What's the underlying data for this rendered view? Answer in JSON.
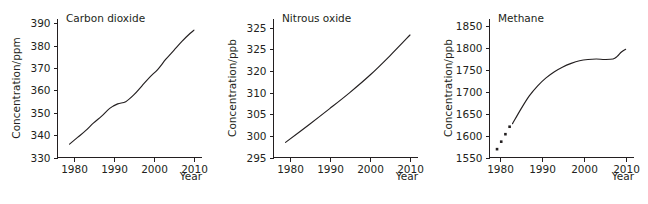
{
  "figure": {
    "background": "#ffffff",
    "ink_color": "#231f20",
    "panel_count": 3
  },
  "chart_data": [
    {
      "type": "line",
      "title": "Carbon dioxide",
      "xlabel": "Year",
      "ylabel": "Concentration/ppm",
      "xlim": [
        1976,
        2012
      ],
      "ylim": [
        330,
        392
      ],
      "xticks": [
        1980,
        1990,
        2000,
        2010
      ],
      "xtick_labels": [
        "1980",
        "1990",
        "2000",
        "2010"
      ],
      "yticks": [
        330,
        340,
        350,
        360,
        370,
        380,
        390
      ],
      "ytick_labels": [
        "330",
        "340",
        "350",
        "360",
        "370",
        "380",
        "390"
      ],
      "grid": false,
      "legend": "none",
      "x": [
        1979,
        1981,
        1983,
        1985,
        1987,
        1989,
        1991,
        1993,
        1995,
        1997,
        1999,
        2001,
        2003,
        2005,
        2007,
        2009,
        2010
      ],
      "values": [
        336.0,
        339.0,
        342.0,
        345.5,
        348.5,
        352.0,
        354.0,
        355.0,
        358.0,
        362.0,
        366.0,
        369.5,
        374.0,
        378.0,
        382.0,
        385.5,
        387.0
      ]
    },
    {
      "type": "line",
      "title": "Nitrous oxide",
      "xlabel": "Year",
      "ylabel": "Concentration/ppb",
      "xlim": [
        1976,
        2012
      ],
      "ylim": [
        295,
        327
      ],
      "xticks": [
        1980,
        1990,
        2000,
        2010
      ],
      "xtick_labels": [
        "1980",
        "1990",
        "2000",
        "2010"
      ],
      "yticks": [
        295,
        300,
        305,
        310,
        315,
        320,
        325
      ],
      "ytick_labels": [
        "295",
        "300",
        "305",
        "310",
        "320",
        "325"
      ],
      "grid": false,
      "legend": "none",
      "x": [
        1979,
        1985,
        1990,
        1995,
        2000,
        2005,
        2010
      ],
      "values": [
        298.5,
        302.7,
        306.3,
        310.0,
        314.0,
        318.5,
        323.3
      ]
    },
    {
      "type": "line",
      "title": "Methane",
      "xlabel": "Year",
      "ylabel": "Concentration/ppb",
      "xlim": [
        1977.5,
        2012
      ],
      "ylim": [
        1550,
        1865
      ],
      "xticks": [
        1980,
        1990,
        2000,
        2010
      ],
      "xtick_labels": [
        "1980",
        "1990",
        "2000",
        "2010"
      ],
      "yticks": [
        1550,
        1600,
        1650,
        1700,
        1750,
        1800,
        1850
      ],
      "ytick_labels": [
        "1550",
        "1600",
        "1650",
        "1700",
        "1750",
        "1800",
        "1850"
      ],
      "grid": false,
      "legend": "none",
      "markers": {
        "x": [
          1979.3,
          1980.3,
          1981.3,
          1982.3
        ],
        "values": [
          1569,
          1586,
          1603,
          1620
        ]
      },
      "x": [
        1983,
        1985,
        1987,
        1989,
        1991,
        1993,
        1995,
        1997,
        1999,
        2001,
        2003,
        2005,
        2007,
        2008,
        2009,
        2010
      ],
      "values": [
        1627,
        1660,
        1690,
        1713,
        1731,
        1745,
        1756,
        1764,
        1770,
        1773,
        1774,
        1773,
        1774,
        1780,
        1790,
        1796
      ]
    }
  ]
}
